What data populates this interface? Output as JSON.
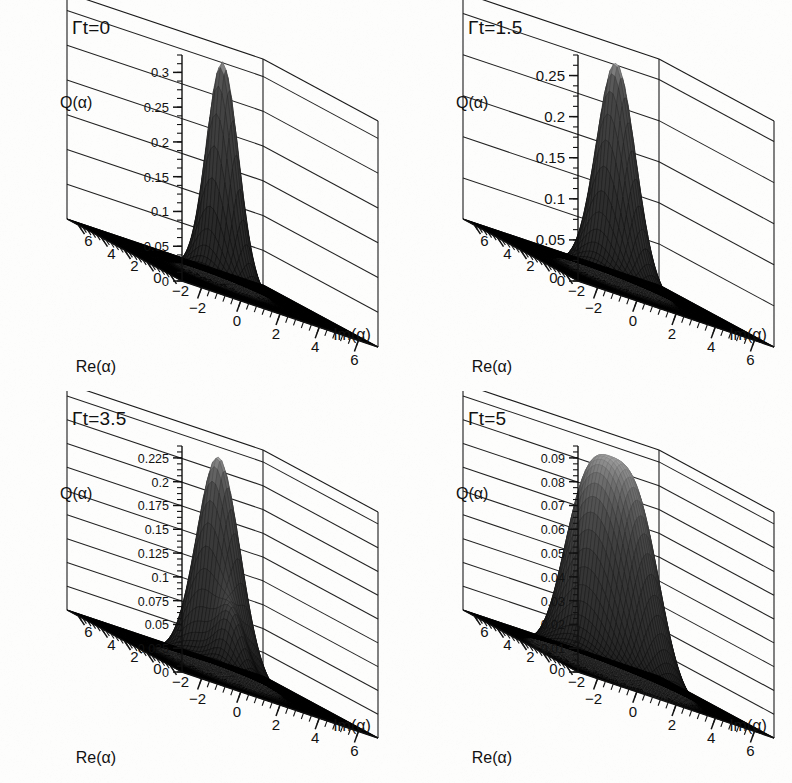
{
  "figure": {
    "background_color": "#fdfdfc",
    "ink_color": "#111111",
    "layout": "2x2 grid of 3D surface plots"
  },
  "chart_data": [
    {
      "type": "surface",
      "title": "Γt=0",
      "zlabel": "Q(α)",
      "xlabel": "Re(α)",
      "ylabel": "Im(α)",
      "xlim": [
        -3,
        7
      ],
      "ylim": [
        -3,
        7
      ],
      "zlim": [
        0,
        0.325
      ],
      "x_ticks": [
        6,
        4,
        2,
        0,
        -2
      ],
      "y_ticks": [
        -2,
        0,
        2,
        4,
        6
      ],
      "z_ticks": [
        0,
        0.05,
        0.1,
        0.15,
        0.2,
        0.25,
        0.3
      ],
      "z_tick_labels": [
        "0",
        "0.05",
        "0.1",
        "0.15",
        "0.2",
        "0.25",
        "0.3"
      ],
      "z_minor_step": 0.0125,
      "grid": true,
      "peak_value": 0.318,
      "peak_center": [
        2.0,
        2.0
      ],
      "peak_width": 1.0,
      "surface_model": "single narrow gaussian peak, coherent state Q-function",
      "annotation": "initial state: tall sharp peak"
    },
    {
      "type": "surface",
      "title": "Γt=1.5",
      "zlabel": "Q(α)",
      "xlabel": "Re(α)",
      "ylabel": "Im(α)",
      "xlim": [
        -3,
        7
      ],
      "ylim": [
        -3,
        7
      ],
      "zlim": [
        0,
        0.275
      ],
      "x_ticks": [
        6,
        4,
        2,
        0,
        -2
      ],
      "y_ticks": [
        -2,
        0,
        2,
        4,
        6
      ],
      "z_ticks": [
        0,
        0.05,
        0.1,
        0.15,
        0.2,
        0.25
      ],
      "z_tick_labels": [
        "0",
        "0.05",
        "0.1",
        "0.15",
        "0.2",
        "0.25"
      ],
      "z_minor_step": 0.0125,
      "grid": true,
      "peak_value": 0.268,
      "peak_center": [
        1.7,
        1.7
      ],
      "peak_width": 1.22,
      "surface_model": "broadened gaussian peak",
      "annotation": "decohered, slightly broadened peak"
    },
    {
      "type": "surface",
      "title": "Γt=3.5",
      "zlabel": "Q(α)",
      "xlabel": "Re(α)",
      "ylabel": "Im(α)",
      "xlim": [
        -3,
        7
      ],
      "ylim": [
        -3,
        7
      ],
      "zlim": [
        0,
        0.2375
      ],
      "x_ticks": [
        6,
        4,
        2,
        0,
        -2
      ],
      "y_ticks": [
        -2,
        0,
        2,
        4,
        6
      ],
      "z_ticks": [
        0,
        0.025,
        0.05,
        0.075,
        0.1,
        0.125,
        0.15,
        0.175,
        0.2,
        0.225
      ],
      "z_tick_labels": [
        "0",
        "0.025",
        "0.05",
        "0.075",
        "0.1",
        "0.125",
        "0.15",
        "0.175",
        "0.2",
        "0.225"
      ],
      "z_minor_step": 0.00625,
      "grid": true,
      "peak_value": 0.228,
      "peak_center": [
        1.5,
        1.5
      ],
      "peak_width": 1.35,
      "secondary_bump_value": 0.055,
      "secondary_bump_center": [
        3.1,
        3.1
      ],
      "secondary_bump_width": 0.85,
      "surface_model": "main peak with small secondary lobe at base",
      "annotation": "bullet-shaped peak with small side bump"
    },
    {
      "type": "surface",
      "title": "Γt=5",
      "zlabel": "Q(α)",
      "xlabel": "Re(α)",
      "ylabel": "Im(α)",
      "xlim": [
        -3,
        7
      ],
      "ylim": [
        -3,
        7
      ],
      "zlim": [
        0,
        0.095
      ],
      "x_ticks": [
        6,
        4,
        2,
        0,
        -2
      ],
      "y_ticks": [
        -2,
        0,
        2,
        4,
        6
      ],
      "z_ticks": [
        0,
        0.01,
        0.02,
        0.03,
        0.04,
        0.05,
        0.06,
        0.07,
        0.08,
        0.09
      ],
      "z_tick_labels": [
        "0",
        "0.01",
        "0.02",
        "0.03",
        "0.04",
        "0.05",
        "0.06",
        "0.07",
        "0.08",
        "0.09"
      ],
      "z_minor_step": 0.0025,
      "grid": true,
      "peak_value": 0.091,
      "peak_center": [
        1.2,
        1.2
      ],
      "peak_width": 2.35,
      "plateau": true,
      "plateau_flatness": 3.1,
      "surface_model": "broad flat-topped plateau (ring / mixed state)",
      "annotation": "wide rounded plateau, strongly spread"
    }
  ]
}
